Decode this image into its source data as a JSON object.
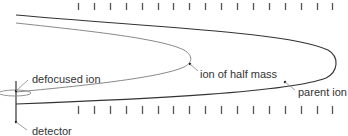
{
  "diagram": {
    "type": "ion-trajectory-schematic",
    "labels": {
      "defocused_ion": "defocused ion",
      "ion_of_half_mass": "ion of half mass",
      "parent_ion": "parent ion",
      "detector": "detector"
    },
    "electrode_ticks": {
      "count_per_row": 17,
      "first_x": 78,
      "spacing": 15.9,
      "top_row_y": [
        3,
        10
      ],
      "bottom_row_y": [
        106,
        114
      ]
    },
    "colors": {
      "parent_ion_path": "#333333",
      "half_mass_path": "#888888",
      "ticks": "#555555",
      "text": "#333333"
    }
  }
}
